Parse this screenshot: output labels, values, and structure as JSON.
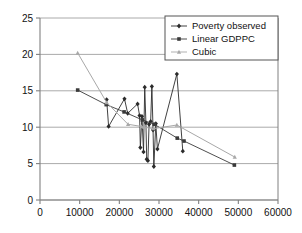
{
  "chart_data": {
    "type": "line",
    "title": "",
    "subtitle": "",
    "xlabel": "",
    "ylabel": "",
    "xlim": [
      0,
      60000
    ],
    "ylim": [
      0,
      25
    ],
    "xticks": [
      0,
      10000,
      20000,
      30000,
      40000,
      50000,
      60000
    ],
    "yticks": [
      0,
      5,
      10,
      15,
      20,
      25
    ],
    "xticklabels": [
      "0",
      "10000",
      "20000",
      "30000",
      "40000",
      "50000",
      "60000"
    ],
    "yticklabels": [
      "0",
      "5",
      "10",
      "15",
      "20",
      "25"
    ],
    "grid": "horizontal",
    "legend_position": "top-right",
    "legend": [
      "Poverty observed",
      "Linear GDPPC",
      "Cubic"
    ],
    "series": [
      {
        "name": "Poverty observed",
        "color": "#2b2b2b",
        "marker": "diamond",
        "points": [
          [
            16800,
            13.8
          ],
          [
            17300,
            10.1
          ],
          [
            21300,
            13.9
          ],
          [
            22100,
            11.9
          ],
          [
            24600,
            13.2
          ],
          [
            25100,
            11.6
          ],
          [
            25300,
            7.2
          ],
          [
            25700,
            11.5
          ],
          [
            26100,
            6.6
          ],
          [
            26400,
            15.5
          ],
          [
            26700,
            10.6
          ],
          [
            26900,
            5.6
          ],
          [
            27200,
            5.4
          ],
          [
            27500,
            10.4
          ],
          [
            27900,
            10.8
          ],
          [
            28200,
            15.6
          ],
          [
            28500,
            9.6
          ],
          [
            28700,
            4.6
          ],
          [
            29200,
            10.5
          ],
          [
            29600,
            7.0
          ],
          [
            34500,
            17.3
          ],
          [
            36000,
            6.7
          ]
        ]
      },
      {
        "name": "Linear GDPPC",
        "color": "#3a3a3a",
        "marker": "square",
        "points": [
          [
            9500,
            15.1
          ],
          [
            16700,
            13.1
          ],
          [
            21200,
            12.1
          ],
          [
            25800,
            11.0
          ],
          [
            28800,
            10.4
          ],
          [
            34600,
            8.5
          ],
          [
            36300,
            8.1
          ],
          [
            49000,
            4.8
          ]
        ]
      },
      {
        "name": "Cubic",
        "color": "#a8a8a8",
        "marker": "triangle",
        "points": [
          [
            9500,
            20.2
          ],
          [
            16800,
            13.4
          ],
          [
            22200,
            10.4
          ],
          [
            25600,
            10.1
          ],
          [
            26300,
            10.0
          ],
          [
            28600,
            9.8
          ],
          [
            34500,
            10.3
          ],
          [
            49100,
            5.9
          ]
        ]
      }
    ]
  },
  "axes": {
    "grid_color": "#a0a0a0",
    "axis_color": "#808080",
    "plot_bg": "#ffffff"
  }
}
